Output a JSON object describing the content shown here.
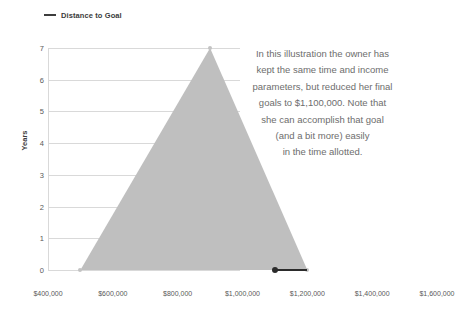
{
  "chart_data": {
    "type": "area",
    "title": "",
    "xlabel": "",
    "ylabel": "Years",
    "xlim": [
      400000,
      1600000
    ],
    "ylim": [
      0,
      7
    ],
    "grid": true,
    "legend_position": "top-left",
    "legend": [
      {
        "name": "Distance to Goal",
        "marker": "line",
        "color": "#3d3d3d"
      }
    ],
    "series": [
      {
        "name": "Distance to Goal",
        "fill_color": "#bfbfbf",
        "type": "area",
        "points": [
          {
            "x": 500000,
            "y": 0
          },
          {
            "x": 900000,
            "y": 7
          },
          {
            "x": 1200000,
            "y": 0
          }
        ]
      },
      {
        "name": "Goal",
        "type": "segment",
        "color": "#2b2b2b",
        "points": [
          {
            "x": 1100000,
            "y": 0
          },
          {
            "x": 1200000,
            "y": 0
          }
        ]
      }
    ],
    "x_ticks": [
      {
        "value": 400000,
        "label": "$400,000"
      },
      {
        "value": 600000,
        "label": "$600,000"
      },
      {
        "value": 800000,
        "label": "$800,000"
      },
      {
        "value": 1000000,
        "label": "$1,000,000"
      },
      {
        "value": 1200000,
        "label": "$1,200,000"
      },
      {
        "value": 1400000,
        "label": "$1,400,000"
      },
      {
        "value": 1600000,
        "label": "$1,600,000"
      }
    ],
    "y_ticks": [
      {
        "value": 0,
        "label": "0"
      },
      {
        "value": 1,
        "label": "1"
      },
      {
        "value": 2,
        "label": "2"
      },
      {
        "value": 3,
        "label": "3"
      },
      {
        "value": 4,
        "label": "4"
      },
      {
        "value": 5,
        "label": "5"
      },
      {
        "value": 6,
        "label": "6"
      },
      {
        "value": 7,
        "label": "7"
      }
    ],
    "annotation": {
      "lines": [
        "In this illustration the owner has",
        "kept the same time and income",
        "parameters, but reduced her final",
        "goals to $1,100,000. Note that",
        "she can accomplish that goal",
        "(and a bit more) easily",
        "in the time allotted."
      ],
      "color": "#6d6d6d"
    }
  },
  "colors": {
    "area_fill": "#bfbfbf",
    "gridline": "#d9d9d9",
    "tick_text": "#595959",
    "legend_text": "#3b3b3b",
    "goal_line": "#2b2b2b",
    "annotation_text": "#6d6d6d",
    "background": "#ffffff"
  }
}
